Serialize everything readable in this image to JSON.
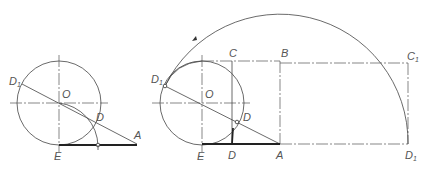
{
  "figure_left": {
    "labels": {
      "D1": "D",
      "D1_sub": "1",
      "O": "O",
      "D": "D",
      "A": "A",
      "E": "E"
    }
  },
  "figure_right": {
    "labels": {
      "D1": "D",
      "D1_sub": "1",
      "O": "O",
      "C": "C",
      "B": "B",
      "C1": "C",
      "C1_sub": "1",
      "D_upper": "D",
      "D_lower": "D",
      "E": "E",
      "A": "A",
      "D1_right": "D",
      "D1_right_sub": "1"
    }
  },
  "colors": {
    "line": "#444444",
    "background": "#ffffff"
  }
}
